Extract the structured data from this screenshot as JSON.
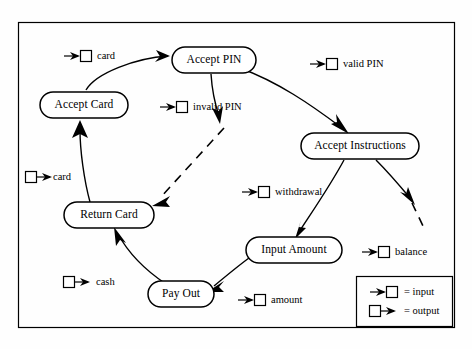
{
  "diagram": {
    "frame": {
      "x": 18,
      "y": 22,
      "width": 436,
      "height": 305
    },
    "colors": {
      "stroke": "#000000",
      "background": "#ffffff",
      "text": "#000000"
    },
    "nodes": [
      {
        "id": "accept-pin",
        "label": "Accept PIN",
        "cx": 214,
        "cy": 60,
        "rx": 42,
        "ry": 13
      },
      {
        "id": "accept-card",
        "label": "Accept Card",
        "cx": 84,
        "cy": 105,
        "rx": 44,
        "ry": 13
      },
      {
        "id": "accept-instructions",
        "label": "Accept Instructions",
        "cx": 360,
        "cy": 146,
        "rx": 59,
        "ry": 13
      },
      {
        "id": "return-card",
        "label": "Return Card",
        "cx": 109,
        "cy": 215,
        "rx": 45,
        "ry": 13
      },
      {
        "id": "input-amount",
        "label": "Input Amount",
        "cx": 294,
        "cy": 250,
        "rx": 48,
        "ry": 13
      },
      {
        "id": "pay-out",
        "label": "Pay Out",
        "cx": 181,
        "cy": 294,
        "rx": 33,
        "ry": 13
      }
    ],
    "flows": [
      {
        "id": "card-in",
        "label": "card",
        "kind": "input",
        "icon_x": 72,
        "icon_y": 56,
        "text_x": 96,
        "text_y": 57
      },
      {
        "id": "invalid-pin",
        "label": "invalid PIN",
        "kind": "input",
        "icon_x": 168,
        "icon_y": 107,
        "text_x": 192,
        "text_y": 108
      },
      {
        "id": "valid-pin",
        "label": "valid PIN",
        "kind": "input",
        "icon_x": 318,
        "icon_y": 64,
        "text_x": 342,
        "text_y": 65
      },
      {
        "id": "card-out",
        "label": "card",
        "kind": "output",
        "icon_x": 26,
        "icon_y": 177,
        "text_x": 52,
        "text_y": 178
      },
      {
        "id": "withdrawal",
        "label": "withdrawal",
        "kind": "input",
        "icon_x": 250,
        "icon_y": 192,
        "text_x": 274,
        "text_y": 193
      },
      {
        "id": "balance",
        "label": "balance",
        "kind": "input",
        "icon_x": 370,
        "icon_y": 252,
        "text_x": 394,
        "text_y": 253
      },
      {
        "id": "cash-out",
        "label": "cash",
        "kind": "output",
        "icon_x": 64,
        "icon_y": 282,
        "text_x": 94,
        "text_y": 283
      },
      {
        "id": "amount",
        "label": "amount",
        "kind": "input",
        "icon_x": 246,
        "icon_y": 300,
        "text_x": 270,
        "text_y": 301
      }
    ],
    "edges": [
      {
        "id": "edge-accept-card-to-accept-pin",
        "from": "accept-card",
        "to": "accept-pin",
        "style": "solid"
      },
      {
        "id": "edge-accept-pin-to-invalid",
        "from": "accept-pin",
        "to": "invalid-branch",
        "style": "solid"
      },
      {
        "id": "edge-accept-pin-to-accept-instructions",
        "from": "accept-pin",
        "to": "accept-instructions",
        "style": "solid"
      },
      {
        "id": "edge-invalid-to-return-card",
        "from": "invalid-branch",
        "to": "return-card",
        "style": "dashed"
      },
      {
        "id": "edge-accept-instructions-to-input-amount",
        "from": "accept-instructions",
        "to": "input-amount",
        "style": "solid"
      },
      {
        "id": "edge-accept-instructions-to-balance",
        "from": "accept-instructions",
        "to": "balance-branch",
        "style": "dashed"
      },
      {
        "id": "edge-input-amount-to-pay-out",
        "from": "input-amount",
        "to": "pay-out",
        "style": "solid"
      },
      {
        "id": "edge-pay-out-to-return-card",
        "from": "pay-out",
        "to": "return-card",
        "style": "solid"
      },
      {
        "id": "edge-return-card-to-accept-card",
        "from": "return-card",
        "to": "accept-card",
        "style": "solid"
      }
    ],
    "legend": {
      "box": {
        "x": 356,
        "y": 276,
        "width": 96,
        "height": 50
      },
      "entries": [
        {
          "id": "legend-input",
          "icon": "input-flow-icon",
          "label": "= input"
        },
        {
          "id": "legend-output",
          "icon": "output-flow-icon",
          "label": "= output"
        }
      ]
    }
  }
}
